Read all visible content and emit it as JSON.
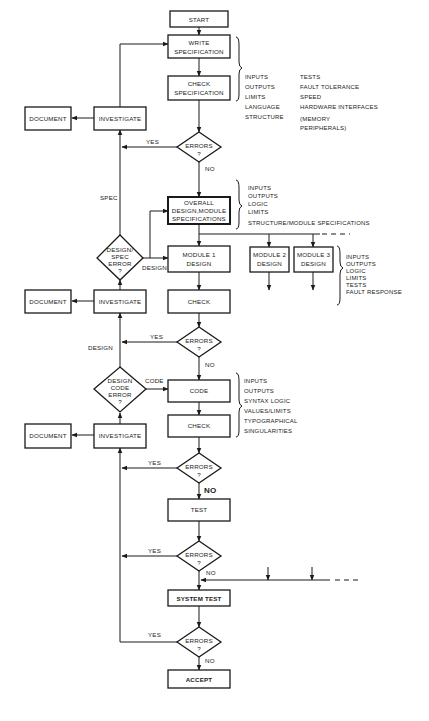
{
  "flowchart": {
    "start": "START",
    "write_spec": [
      "WRITE",
      "SPECIFICATION"
    ],
    "check_spec": [
      "CHECK",
      "SPECIFICATION"
    ],
    "errors_label": [
      "ERRORS",
      "?"
    ],
    "overall_design": [
      "OVERALL",
      "DESIGN,MODULE",
      "SPECIFICATIONS"
    ],
    "module1": [
      "MODULE 1",
      "DESIGN"
    ],
    "module2": [
      "MODULE 2",
      "DESIGN"
    ],
    "module3": [
      "MODULE 3",
      "DESIGN"
    ],
    "check": "CHECK",
    "code": "CODE",
    "test": "TEST",
    "system_test": "SYSTEM TEST",
    "accept": "ACCEPT",
    "investigate": "INVESTIGATE",
    "document": "DOCUMENT",
    "design_spec_error": [
      "DESIGN/",
      "SPEC",
      "ERROR",
      "?"
    ],
    "design_code_error": [
      "DESIGN",
      "CODE",
      "ERROR",
      "?"
    ],
    "yes": "YES",
    "no": "NO",
    "spec": "SPEC",
    "design": "DESIGN",
    "code_branch": "CODE"
  },
  "notes": {
    "spec_col1": [
      "INPUTS",
      "OUTPUTS",
      "LIMITS",
      "LANGUAGE",
      "STRUCTURE"
    ],
    "spec_col2": [
      "TESTS",
      "FAULT TOLERANCE",
      "SPEED",
      "HARDWARE INTERFACES",
      "(MEMORY",
      "PERIPHERALS)"
    ],
    "design": [
      "INPUTS",
      "OUTPUTS",
      "LOGIC",
      "LIMITS",
      "STRUCTURE/MODULE SPECIFICATIONS"
    ],
    "module": [
      "INPUTS",
      "OUTPUTS",
      "LOGIC",
      "LIMITS",
      "TESTS",
      "FAULT RESPONSE"
    ],
    "code": [
      "INPUTS",
      "OUTPUTS",
      "SYNTAX LOGIC",
      "VALUES/LIMITS",
      "TYPOGRAPHICAL",
      "SINGULARITIES"
    ]
  }
}
